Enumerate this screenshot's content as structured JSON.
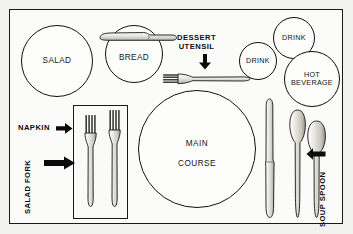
{
  "diagram": {
    "background_color": "#f2f2f0",
    "frame_color": "#1b1b1b",
    "interior_color": "#fbfbf9"
  },
  "plates": [
    {
      "id": "salad",
      "label": "SALAD",
      "cx": 56,
      "cy": 61,
      "r": 36
    },
    {
      "id": "bread",
      "label": "BREAD",
      "cx": 133,
      "cy": 53,
      "r": 29
    },
    {
      "id": "main_course",
      "label": "MAIN\nCOURSE",
      "cx": 196,
      "cy": 157,
      "r": 59
    }
  ],
  "glasses": [
    {
      "id": "drink_small",
      "label": "DRINK",
      "cx": 257,
      "cy": 60,
      "r": 19
    },
    {
      "id": "drink_large",
      "label": "DRINK",
      "cx": 293,
      "cy": 37,
      "r": 21
    },
    {
      "id": "hot_beverage",
      "label": "HOT\nBEVERAGE",
      "cx": 311,
      "cy": 78,
      "r": 28
    }
  ],
  "napkin": {
    "id": "napkin",
    "x": 72,
    "y": 104,
    "width": 55,
    "height": 114,
    "forks_on_napkin": 2
  },
  "utensils": [
    {
      "id": "butter-knife",
      "type": "knife",
      "orientation": "horizontal",
      "location": "on-bread-plate"
    },
    {
      "id": "dessert-fork",
      "type": "fork",
      "orientation": "horizontal",
      "location": "above-main-plate"
    },
    {
      "id": "salad-fork",
      "type": "fork",
      "orientation": "vertical",
      "location": "napkin-left"
    },
    {
      "id": "dinner-fork",
      "type": "fork",
      "orientation": "vertical",
      "location": "napkin-right"
    },
    {
      "id": "dinner-knife",
      "type": "knife",
      "orientation": "vertical",
      "location": "right-of-plate"
    },
    {
      "id": "teaspoon",
      "type": "spoon",
      "orientation": "vertical",
      "location": "right-of-knife"
    },
    {
      "id": "soup-spoon",
      "type": "spoon",
      "orientation": "vertical",
      "location": "far-right"
    }
  ],
  "callouts": [
    {
      "id": "dessert-utensil",
      "label": "DESSERT\nUTENSIL",
      "arrow": "down"
    },
    {
      "id": "napkin",
      "label": "NAPKIN",
      "arrow": "right"
    },
    {
      "id": "salad-fork",
      "label": "SALAD FORK",
      "arrow": "right"
    },
    {
      "id": "soup-spoon",
      "label": "SOUP SPOON",
      "arrow": "left"
    }
  ],
  "labels": {
    "salad": "SALAD",
    "bread": "BREAD",
    "main_course_line1": "MAIN",
    "main_course_line2": "COURSE",
    "drink_small": "DRINK",
    "drink_large": "DRINK",
    "hot_beverage_line1": "HOT",
    "hot_beverage_line2": "BEVERAGE",
    "dessert_utensil_line1": "DESSERT",
    "dessert_utensil_line2": "UTENSIL",
    "napkin": "NAPKIN",
    "salad_fork": "SALAD FORK",
    "soup_spoon": "SOUP SPOON"
  },
  "colors": {
    "outline": "#111111",
    "utensil_fill_light": "#f0efec",
    "utensil_fill_mid": "#d8d6d0",
    "utensil_fill_dark": "#8d8b85",
    "tine_dark": "#3a3a38",
    "text": "#141414"
  }
}
